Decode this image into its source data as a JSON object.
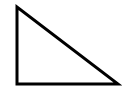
{
  "diagram": {
    "shape": "right-triangle",
    "stroke_color": "#000000",
    "fill_color": "#ffffff",
    "stroke_width": 3,
    "vertices": [
      [
        17,
        7
      ],
      [
        17,
        84
      ],
      [
        118,
        84
      ]
    ]
  }
}
